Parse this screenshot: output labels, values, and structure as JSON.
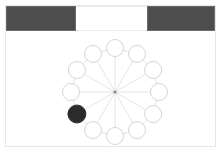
{
  "canvas": {
    "width": 221,
    "height": 153,
    "background": "#ffffff",
    "border_color": "#e8e8ea"
  },
  "top_panel": {
    "bars": [
      {
        "name": "left-bar",
        "label": "",
        "x": 6,
        "y": 6,
        "width": 70,
        "height": 25,
        "color": "#4d4d4d"
      },
      {
        "name": "right-bar",
        "label": "",
        "x": 147,
        "y": 6,
        "width": 68,
        "height": 25,
        "color": "#4d4d4d"
      }
    ],
    "gap": {
      "name": "center-gap",
      "label": "",
      "x": 76,
      "y": 6,
      "width": 71,
      "height": 25,
      "color": "#ffffff"
    }
  },
  "graph": {
    "type": "wheel-graph",
    "hub": {
      "id": "hub",
      "cx": 115,
      "cy": 92,
      "r": 1.6,
      "color": "#8a8a8a"
    },
    "ring": {
      "center_x": 115,
      "center_y": 92,
      "radius": 44,
      "node_radius": 8.5,
      "node_count": 12
    },
    "node_fill": "#ffffff",
    "node_stroke": "#d0d0d0",
    "selected_fill": "#2b2b2b",
    "edge_color": "#d8d8d8",
    "nodes": [
      {
        "id": "n0",
        "angle_deg": 270,
        "cx": 115.0,
        "cy": 48.0,
        "selected": false
      },
      {
        "id": "n1",
        "angle_deg": 300,
        "cx": 153.1,
        "cy": 70.0,
        "selected": false
      },
      {
        "id": "n2",
        "angle_deg": 330,
        "cx": 153.1,
        "cy": 114.0,
        "selected": false
      },
      {
        "id": "n3",
        "angle_deg": 0,
        "cx": 159.0,
        "cy": 92.0,
        "selected": false
      },
      {
        "id": "n4",
        "angle_deg": 30,
        "cx": 138.0,
        "cy": 130.1,
        "selected": false
      },
      {
        "id": "n5",
        "angle_deg": 60,
        "cx": 115.0,
        "cy": 136.0,
        "selected": false
      },
      {
        "id": "n6",
        "angle_deg": 90,
        "cx": 92.0,
        "cy": 130.1,
        "selected": false
      },
      {
        "id": "n7",
        "angle_deg": 120,
        "cx": 76.9,
        "cy": 114.0,
        "selected": false
      },
      {
        "id": "n8",
        "angle_deg": 150,
        "cx": 71.0,
        "cy": 92.0,
        "selected": true
      },
      {
        "id": "n9",
        "angle_deg": 180,
        "cx": 76.9,
        "cy": 70.0,
        "selected": false
      },
      {
        "id": "n10",
        "angle_deg": 210,
        "cx": 92.0,
        "cy": 53.9,
        "selected": false
      },
      {
        "id": "n11",
        "angle_deg": 240,
        "cx": 138.0,
        "cy": 53.9,
        "selected": false
      }
    ]
  }
}
